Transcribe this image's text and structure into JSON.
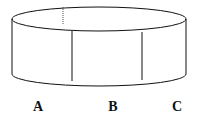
{
  "diagram": {
    "shape": "cylinder",
    "labels": [
      {
        "id": "A",
        "text": "A",
        "x": 38
      },
      {
        "id": "B",
        "text": "B",
        "x": 113
      },
      {
        "id": "C",
        "text": "C",
        "x": 177
      }
    ],
    "stroke_color": "#111111"
  }
}
